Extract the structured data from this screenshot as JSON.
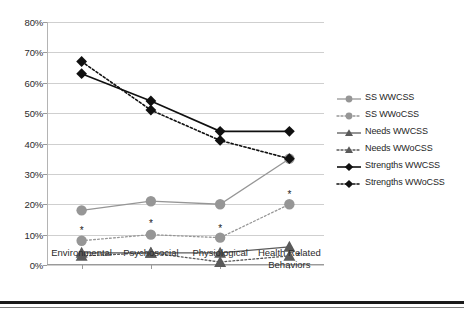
{
  "chart_data": {
    "type": "line",
    "title": "",
    "xlabel": "",
    "ylabel": "",
    "categories": [
      "Environmental",
      "Psychosocial",
      "Physiological",
      "Health Related Behaviors"
    ],
    "ylim": [
      0,
      80
    ],
    "ytick_step": 10,
    "ytick_labels": [
      "0%",
      "10%",
      "20%",
      "30%",
      "40%",
      "50%",
      "60%",
      "70%",
      "80%"
    ],
    "ytick_values": [
      0,
      10,
      20,
      30,
      40,
      50,
      60,
      70,
      80
    ],
    "grid": true,
    "legend_position": "right",
    "series": [
      {
        "name": "SS WWCSS",
        "values": [
          18,
          21,
          20,
          35
        ],
        "color": "#969696",
        "line": "solid",
        "marker": "circle"
      },
      {
        "name": "SS WWoCSS",
        "values": [
          8,
          10,
          9,
          20
        ],
        "color": "#969696",
        "line": "dotted",
        "marker": "circle"
      },
      {
        "name": "Needs WWCSS",
        "values": [
          4,
          4,
          4,
          6
        ],
        "color": "#5a5a5a",
        "line": "solid",
        "marker": "triangle"
      },
      {
        "name": "Needs WWoCSS",
        "values": [
          3,
          4,
          1,
          3
        ],
        "color": "#5a5a5a",
        "line": "dotted",
        "marker": "triangle"
      },
      {
        "name": "Strengths WWCSS",
        "values": [
          63,
          54,
          44,
          44
        ],
        "color": "#101010",
        "line": "solid",
        "marker": "diamond"
      },
      {
        "name": "Strengths WWoCSS",
        "values": [
          67,
          51,
          41,
          35
        ],
        "color": "#101010",
        "line": "dotted",
        "marker": "diamond"
      }
    ],
    "annotations": [
      {
        "text": "*",
        "category": "Environmental",
        "value": 12
      },
      {
        "text": "*",
        "category": "Psychosocial",
        "value": 14
      },
      {
        "text": "*",
        "category": "Physiological",
        "value": 12.6
      },
      {
        "text": "*",
        "category": "Health Related Behaviors",
        "value": 23.8
      },
      {
        "text": "*",
        "category": "Health Related Behaviors",
        "value": 3.2
      }
    ]
  },
  "legend": {
    "items": [
      {
        "label": "SS WWCSS"
      },
      {
        "label": "SS WWoCSS"
      },
      {
        "label": "Needs WWCSS"
      },
      {
        "label": "Needs WWoCSS"
      },
      {
        "label": "Strengths WWCSS"
      },
      {
        "label": "Strengths WWoCSS"
      }
    ]
  }
}
